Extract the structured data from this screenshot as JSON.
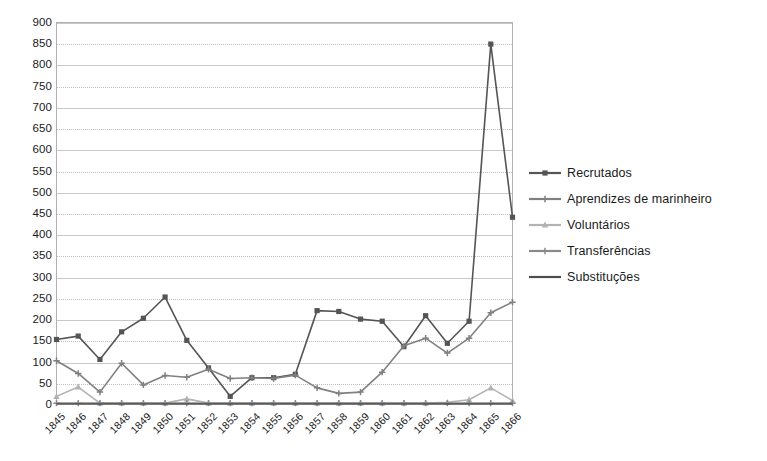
{
  "chart": {
    "title": "",
    "subtitle": "",
    "xlabel": "",
    "ylabel": ""
  },
  "axes": {
    "y_ticks": [
      "0",
      "50",
      "100",
      "150",
      "200",
      "250",
      "300",
      "350",
      "400",
      "450",
      "500",
      "550",
      "600",
      "650",
      "700",
      "750",
      "800",
      "850",
      "900"
    ],
    "x_ticks": [
      "1845",
      "1846",
      "1847",
      "1848",
      "1849",
      "1850",
      "1851",
      "1852",
      "1853",
      "1854",
      "1855",
      "1856",
      "1857",
      "1858",
      "1859",
      "1860",
      "1861",
      "1862",
      "1863",
      "1864",
      "1865",
      "1866"
    ]
  },
  "legend": {
    "position": "right",
    "items": [
      {
        "label": "Recrutados",
        "color": "#555555",
        "marker": "square"
      },
      {
        "label": "Aprendizes de marinheiro",
        "color": "#808080",
        "marker": "plus"
      },
      {
        "label": "Voluntários",
        "color": "#b3b3b3",
        "marker": "triangle"
      },
      {
        "label": "Transferências",
        "color": "#8a8a8a",
        "marker": "plus"
      },
      {
        "label": "Substituções",
        "color": "#4d4d4d",
        "marker": "line"
      }
    ]
  },
  "chart_data": {
    "type": "line",
    "title": "",
    "xlabel": "",
    "ylabel": "",
    "ylim": [
      0,
      900
    ],
    "ytick_step": 50,
    "grid": true,
    "legend_position": "right",
    "categories": [
      "1845",
      "1846",
      "1847",
      "1848",
      "1849",
      "1850",
      "1851",
      "1852",
      "1853",
      "1854",
      "1855",
      "1856",
      "1857",
      "1858",
      "1859",
      "1860",
      "1861",
      "1862",
      "1863",
      "1864",
      "1865",
      "1866"
    ],
    "series": [
      {
        "name": "Recrutados",
        "color": "#555555",
        "marker": "square",
        "values": [
          152,
          160,
          105,
          170,
          202,
          252,
          150,
          85,
          18,
          62,
          62,
          70,
          220,
          218,
          200,
          195,
          135,
          208,
          143,
          195,
          848,
          440
        ]
      },
      {
        "name": "Aprendizes de marinheiro",
        "color": "#808080",
        "marker": "plus",
        "values": [
          102,
          72,
          28,
          96,
          45,
          67,
          63,
          82,
          60,
          62,
          60,
          68,
          38,
          25,
          28,
          75,
          137,
          155,
          120,
          155,
          215,
          240
        ]
      },
      {
        "name": "Voluntários",
        "color": "#b3b3b3",
        "marker": "triangle",
        "values": [
          18,
          40,
          2,
          2,
          2,
          2,
          12,
          2,
          2,
          2,
          2,
          2,
          2,
          2,
          2,
          2,
          2,
          2,
          4,
          10,
          38,
          8
        ]
      },
      {
        "name": "Transferências",
        "color": "#8a8a8a",
        "marker": "plus",
        "values": [
          2,
          2,
          2,
          2,
          2,
          2,
          2,
          2,
          2,
          2,
          2,
          2,
          2,
          2,
          2,
          2,
          2,
          2,
          2,
          2,
          2,
          2
        ]
      },
      {
        "name": "Substituções",
        "color": "#4d4d4d",
        "marker": "line",
        "values": [
          0,
          0,
          0,
          0,
          0,
          0,
          0,
          0,
          0,
          0,
          0,
          0,
          0,
          0,
          0,
          0,
          0,
          0,
          0,
          0,
          0,
          0
        ]
      }
    ]
  }
}
